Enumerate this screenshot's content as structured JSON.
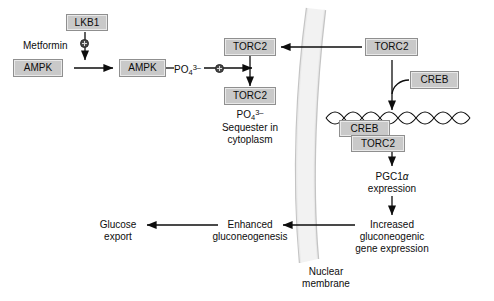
{
  "diagram": {
    "colors": {
      "box_fill": "#c9c9c9",
      "box_border": "#8f8f8f",
      "stroke": "#0d0d0d",
      "membrane": "#c4c4c4",
      "membrane_fill": "#eeeeee",
      "marker_fill": "#4a4a4a"
    }
  },
  "nodes": {
    "lkb1": {
      "label": "LKB1"
    },
    "ampk_inactive": {
      "label": "AMPK"
    },
    "ampk_active": {
      "label": "AMPK"
    },
    "torc2_cyto_top": {
      "label": "TORC2"
    },
    "torc2_cyto_phos": {
      "label": "TORC2"
    },
    "torc2_nuclear": {
      "label": "TORC2"
    },
    "creb_free": {
      "label": "CREB"
    },
    "creb_bound": {
      "label": "CREB"
    },
    "torc2_bound": {
      "label": "TORC2"
    }
  },
  "labels": {
    "metformin": "Metformin",
    "phosphate_on_ampk": {
      "formula": "PO",
      "sub": "4",
      "sup": "3–"
    },
    "phosphate_on_torc2": {
      "formula": "PO",
      "sub": "4",
      "sup": "3–"
    },
    "sequester_line1": "Sequester in",
    "sequester_line2": "cytoplasm",
    "pgc1a_line1_prefix": "PGC1",
    "pgc1a_line1_symbol": "α",
    "pgc1a_line2": "expression",
    "increased_line1": "Increased",
    "increased_line2": "gluconeogenic",
    "increased_line3": "gene expression",
    "enhanced_line1": "Enhanced",
    "enhanced_line2": "gluconeogenesis",
    "glucose_line1": "Glucose",
    "glucose_line2": "export",
    "nuclear_membrane_line1": "Nuclear",
    "nuclear_membrane_line2": "membrane"
  },
  "markers": {
    "metformin_activation": "plus-circle",
    "phosphorylation_activation": "plus-circle"
  }
}
